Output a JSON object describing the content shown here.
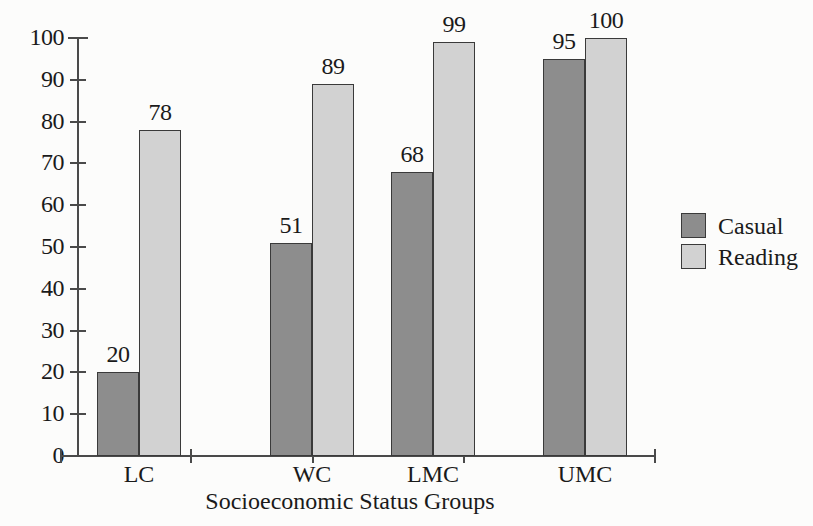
{
  "chart_data": {
    "type": "bar",
    "title": "",
    "subtitle": "",
    "categories": [
      "LC",
      "WC",
      "LMC",
      "UMC"
    ],
    "series": [
      {
        "name": "Casual",
        "color": "#8d8d8d",
        "values": [
          20,
          51,
          68,
          95
        ]
      },
      {
        "name": "Reading",
        "color": "#d2d2d2",
        "values": [
          78,
          89,
          99,
          100
        ]
      }
    ],
    "xlabel": "Socioeconomic Status Groups",
    "ylabel": "",
    "ylim": [
      0,
      100
    ],
    "ytick_labels": [
      "0",
      "10",
      "20",
      "30",
      "40",
      "50",
      "60",
      "70",
      "80",
      "90",
      "100"
    ],
    "ytick_values": [
      0,
      10,
      20,
      30,
      40,
      50,
      60,
      70,
      80,
      90,
      100
    ],
    "grid": false,
    "legend_position": "right",
    "data_labels": true
  },
  "axis": {
    "x_title": "Socioeconomic Status Groups",
    "y_ticks": [
      {
        "label": "100",
        "value": 100
      },
      {
        "label": "90",
        "value": 90
      },
      {
        "label": "80",
        "value": 80
      },
      {
        "label": "70",
        "value": 70
      },
      {
        "label": "60",
        "value": 60
      },
      {
        "label": "50",
        "value": 50
      },
      {
        "label": "40",
        "value": 40
      },
      {
        "label": "30",
        "value": 30
      },
      {
        "label": "20",
        "value": 20
      },
      {
        "label": "10",
        "value": 10
      },
      {
        "label": "0",
        "value": 0
      }
    ]
  },
  "groups": [
    {
      "label": "LC",
      "casual": "20",
      "reading": "78"
    },
    {
      "label": "WC",
      "casual": "51",
      "reading": "89"
    },
    {
      "label": "LMC",
      "casual": "68",
      "reading": "99"
    },
    {
      "label": "UMC",
      "casual": "95",
      "reading": "100"
    }
  ],
  "legend": {
    "items": [
      {
        "label": "Casual",
        "color": "#8d8d8d"
      },
      {
        "label": "Reading",
        "color": "#d2d2d2"
      }
    ]
  },
  "colors": {
    "casual": "#8d8d8d",
    "reading": "#d2d2d2",
    "axis": "#4a4a4a",
    "bar_outline": "#3a3a3a",
    "background": "#fcfcfb",
    "text": "#1a1a1a"
  }
}
